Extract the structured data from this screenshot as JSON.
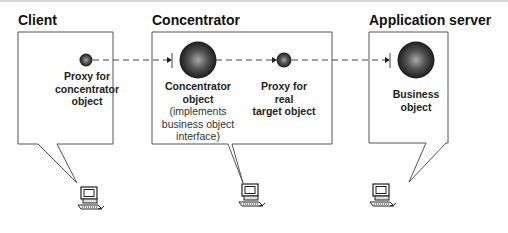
{
  "nodes": {
    "client": {
      "heading": "Client",
      "object_label": [
        "Proxy for",
        "concentrator",
        "object"
      ]
    },
    "concentrator": {
      "heading": "Concentrator",
      "object_label": [
        "Concentrator",
        "object"
      ],
      "object_note": [
        "(implements",
        "business object",
        "interface)"
      ],
      "proxy_label": [
        "Proxy for",
        "real",
        "target object"
      ]
    },
    "application_server": {
      "heading": "Application server",
      "object_label": [
        "Business",
        "object"
      ]
    }
  },
  "icons": {
    "object": "sphere-icon",
    "computer": "computer-icon"
  },
  "colors": {
    "line": "#444444",
    "sphere_dark": "#1a1a1a",
    "sphere_light": "#9a9a9a"
  }
}
